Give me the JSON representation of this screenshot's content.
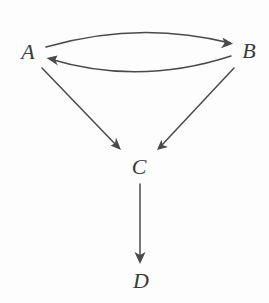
{
  "diagram": {
    "background_color": "#fdfdfd",
    "stroke_color": "#4a4a4a",
    "label_color": "#3b3b3b",
    "nodes": [
      {
        "id": "A",
        "label": "A",
        "x": 28,
        "y": 52
      },
      {
        "id": "B",
        "label": "B",
        "x": 249,
        "y": 51
      },
      {
        "id": "C",
        "label": "C",
        "x": 139,
        "y": 167
      },
      {
        "id": "D",
        "label": "D",
        "x": 141,
        "y": 281
      }
    ],
    "edges": [
      {
        "id": "a-to-b",
        "from": "A",
        "to": "B",
        "style": "curved-up",
        "arrow": "end"
      },
      {
        "id": "b-to-a",
        "from": "B",
        "to": "A",
        "style": "curved-down",
        "arrow": "end"
      },
      {
        "id": "a-to-c",
        "from": "A",
        "to": "C",
        "style": "straight",
        "arrow": "end"
      },
      {
        "id": "b-to-c",
        "from": "B",
        "to": "C",
        "style": "straight",
        "arrow": "end"
      },
      {
        "id": "c-to-d",
        "from": "C",
        "to": "D",
        "style": "straight",
        "arrow": "end"
      }
    ]
  }
}
